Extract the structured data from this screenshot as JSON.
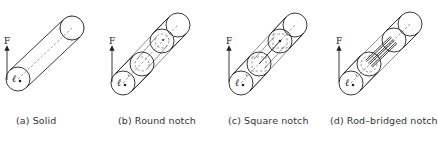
{
  "figure": {
    "force_label": "F",
    "length_label": "ℓ",
    "stroke_color": "#222222",
    "background": "#ffffff",
    "panels": [
      {
        "id": "a",
        "caption": "(a) Solid",
        "caption_x": 16,
        "type": "solid",
        "arrow": {
          "x": 7,
          "y1": 66,
          "y2": 48,
          "label_y": 46
        },
        "front": {
          "cx": 18,
          "cy": 79,
          "r": 12
        },
        "back": {
          "cx": 72,
          "cy": 28,
          "r": 12
        }
      },
      {
        "id": "b",
        "caption": "(b) Round notch",
        "caption_x": 118,
        "type": "round-notch",
        "arrow": {
          "x": 112,
          "y1": 68,
          "y2": 48,
          "label_y": 46
        },
        "front": {
          "cx": 123,
          "cy": 83,
          "r": 12
        },
        "notch_start": {
          "cx": 142,
          "cy": 64,
          "r": 12
        },
        "notch_end": {
          "cx": 162,
          "cy": 41,
          "r": 12
        },
        "back": {
          "cx": 178,
          "cy": 25,
          "r": 12
        },
        "inner_r": 7
      },
      {
        "id": "c",
        "caption": "(c) Square notch",
        "caption_x": 228,
        "type": "square-notch",
        "arrow": {
          "x": 229,
          "y1": 68,
          "y2": 48,
          "label_y": 46
        },
        "front": {
          "cx": 241,
          "cy": 83,
          "r": 12
        },
        "notch_start": {
          "cx": 259,
          "cy": 64,
          "r": 12
        },
        "notch_end": {
          "cx": 280,
          "cy": 41,
          "r": 12
        },
        "back": {
          "cx": 295,
          "cy": 25,
          "r": 12
        },
        "inner_half": 7
      },
      {
        "id": "d",
        "caption": "(d) Rod–bridged notch",
        "caption_x": 330,
        "type": "rod-bridged-notch",
        "arrow": {
          "x": 339,
          "y1": 68,
          "y2": 48,
          "label_y": 46
        },
        "front": {
          "cx": 351,
          "cy": 83,
          "r": 12
        },
        "notch_start": {
          "cx": 369,
          "cy": 64,
          "r": 12
        },
        "notch_end": {
          "cx": 394,
          "cy": 40,
          "r": 12
        },
        "back": {
          "cx": 410,
          "cy": 24,
          "r": 12
        },
        "rod_offsets": [
          -5,
          -1,
          3
        ]
      }
    ]
  }
}
